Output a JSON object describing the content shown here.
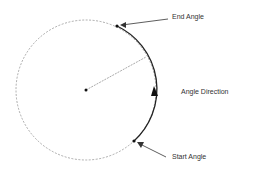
{
  "diagram": {
    "labels": {
      "end_angle": "End Angle",
      "start_angle": "Start Angle",
      "angle_direction": "Angle Direction"
    },
    "colors": {
      "stroke": "#333333",
      "dashed": "#777777",
      "background": "#ffffff"
    }
  }
}
